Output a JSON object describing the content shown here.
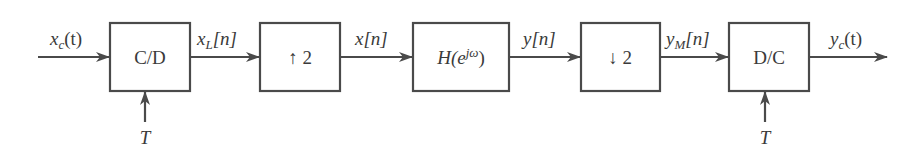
{
  "diagram": {
    "type": "block-diagram",
    "title": "",
    "blocks": [
      {
        "id": "cd",
        "label": "C/D",
        "x": 110,
        "y": 23,
        "w": 80,
        "h": 68
      },
      {
        "id": "up",
        "label": "↑ 2",
        "x": 260,
        "y": 23,
        "w": 80,
        "h": 68
      },
      {
        "id": "h",
        "label": "H(e^jω)",
        "label_main": "H(e",
        "label_sup": "jω",
        "label_close": ")",
        "x": 413,
        "y": 23,
        "w": 96,
        "h": 68
      },
      {
        "id": "down",
        "label": "↓ 2",
        "x": 581,
        "y": 23,
        "w": 79,
        "h": 68
      },
      {
        "id": "dc",
        "label": "D/C",
        "x": 729,
        "y": 23,
        "w": 80,
        "h": 68
      }
    ],
    "signals": {
      "input": {
        "base": "x",
        "sub": "c",
        "arg": "(t)"
      },
      "xL": {
        "base": "x",
        "sub": "L",
        "arg": "[n]"
      },
      "x": {
        "base": "x",
        "arg": "[n]"
      },
      "y": {
        "base": "y",
        "arg": "[n]"
      },
      "yM": {
        "base": "y",
        "sub": "M",
        "arg": "[n]"
      },
      "output": {
        "base": "y",
        "sub": "c",
        "arg": "(t)"
      }
    },
    "sampling_inputs": [
      {
        "block": "cd",
        "label": "T"
      },
      {
        "block": "dc",
        "label": "T"
      }
    ],
    "edges": [
      {
        "from": "input",
        "to": "cd",
        "label": "x_c(t)"
      },
      {
        "from": "cd",
        "to": "up",
        "label": "x_L[n]"
      },
      {
        "from": "up",
        "to": "h",
        "label": "x[n]"
      },
      {
        "from": "h",
        "to": "down",
        "label": "y[n]"
      },
      {
        "from": "down",
        "to": "dc",
        "label": "y_M[n]"
      },
      {
        "from": "dc",
        "to": "output",
        "label": "y_c(t)"
      }
    ],
    "colors": {
      "stroke": "#4a4a4a",
      "text": "#3a3a3a",
      "background": "#ffffff"
    }
  }
}
